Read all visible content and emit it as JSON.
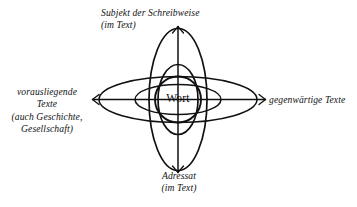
{
  "diagram": {
    "center": {
      "word": "Wort"
    },
    "labels": {
      "top": {
        "line1": "Subjekt der Schreibweise",
        "line2": "(im Text)"
      },
      "bottom": {
        "line1": "Adressat",
        "line2": "(im Text)"
      },
      "left": {
        "line1": "vorausliegende",
        "line2": "Texte",
        "line3": "(auch Geschichte,",
        "line4": "Gesellschaft)"
      },
      "right": {
        "line1": "gegenwärtige Texte"
      }
    },
    "colors": {
      "stroke": "#111111",
      "background": "#ffffff",
      "text": "#121212"
    },
    "shapes": {
      "ellipse_large_vertical": {
        "cx": 178,
        "cy": 99.5,
        "rx": 29,
        "ry": 71
      },
      "ellipse_large_horizontal": {
        "cx": 178,
        "cy": 99.5,
        "rx": 79,
        "ry": 23
      },
      "ellipse_small_vertical": {
        "cx": 178,
        "cy": 99.5,
        "rx": 20,
        "ry": 35
      },
      "ellipse_small_horizontal": {
        "cx": 178,
        "cy": 99.5,
        "rx": 43,
        "ry": 15
      },
      "circle_center": {
        "cx": 178,
        "cy": 99.5,
        "r": 23
      },
      "axis_vertical": {
        "x": 178,
        "y1": 26,
        "y2": 173
      },
      "axis_horizontal": {
        "y": 99.5,
        "x1": 92,
        "x2": 266
      }
    }
  }
}
